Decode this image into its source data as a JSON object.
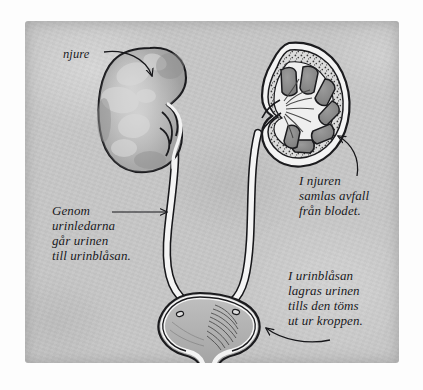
{
  "illustration": {
    "title": "Urinvagarna - njurar, urinledare och urinblasa",
    "language": "Swedish",
    "background_color": "#c6c6c6",
    "ink_color": "#17171a",
    "organ_fill_color": "#a8a8a8",
    "pyramid_color": "#8a8a8a",
    "tube_fill_color": "#f2f2f2"
  },
  "labels": {
    "kidney_pointer": "njure",
    "ureter_caption_lines": [
      "Genom",
      "urinledarna",
      "går urinen",
      "till urinblåsan."
    ],
    "kidney_caption_lines": [
      "I njuren",
      "samlas avfall",
      "från blodet."
    ],
    "bladder_caption_lines": [
      "I urinblåsan",
      "lagras urinen",
      "tills den töms",
      "ut ur kroppen."
    ]
  },
  "anatomy": {
    "left_kidney": {
      "name": "kidney-exterior",
      "view": "whole organ, bean shape, mottled shading"
    },
    "right_kidney": {
      "name": "kidney-cross-section",
      "view": "cut open, stippled cortex with renal pyramids",
      "pyramid_count": 7
    },
    "ureters": {
      "name": "ureter-tubes",
      "count": 2
    },
    "bladder": {
      "name": "urinary-bladder",
      "ureter_openings": 2
    },
    "urethra": {
      "name": "urethra-tube"
    }
  },
  "arrows": [
    {
      "name": "arrow-to-kidney",
      "from": "njure",
      "to": "left kidney"
    },
    {
      "name": "arrow-to-ureter",
      "from": "ureter caption",
      "to": "left ureter"
    },
    {
      "name": "arrow-to-kidney-section",
      "from": "kidney caption",
      "to": "right kidney"
    },
    {
      "name": "arrow-to-bladder",
      "from": "bladder caption",
      "to": "bladder"
    }
  ]
}
